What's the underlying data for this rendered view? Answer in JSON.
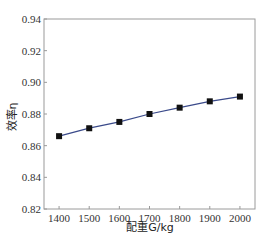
{
  "chart_data": {
    "type": "line",
    "title": "",
    "xlabel": "配重G/kg",
    "ylabel": "效率η",
    "x": [
      1400,
      1500,
      1600,
      1700,
      1800,
      1900,
      2000
    ],
    "series": [
      {
        "name": "效率η",
        "values": [
          0.866,
          0.871,
          0.875,
          0.88,
          0.884,
          0.888,
          0.891
        ],
        "color": "#3a4a8a",
        "marker": "square"
      }
    ],
    "xticks": [
      1400,
      1500,
      1600,
      1700,
      1800,
      1900,
      2000
    ],
    "yticks": [
      0.82,
      0.84,
      0.86,
      0.88,
      0.9,
      0.92,
      0.94
    ],
    "xlim": [
      1350,
      2050
    ],
    "ylim": [
      0.82,
      0.94
    ],
    "grid": false,
    "legend": null
  },
  "colors": {
    "frame": "#9a9a9a",
    "line": "#3a4a8a",
    "marker": "#111111"
  }
}
